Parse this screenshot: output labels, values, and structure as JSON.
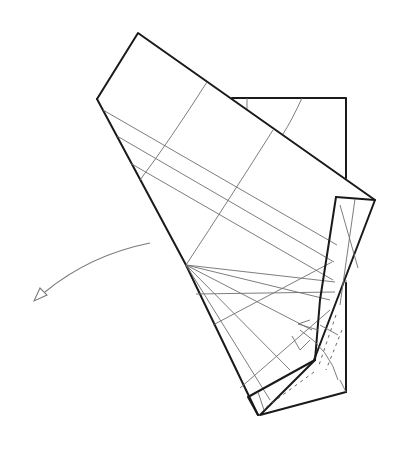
{
  "figure": {
    "type": "origami-folding-step",
    "colors": {
      "edge": "#1a1a1a",
      "crease": "#6e6e6e",
      "arrow": "#7a7a7a",
      "background": "#ffffff"
    },
    "arrow": {
      "direction": "lower-left",
      "style": "valley-fold-arrow"
    }
  }
}
